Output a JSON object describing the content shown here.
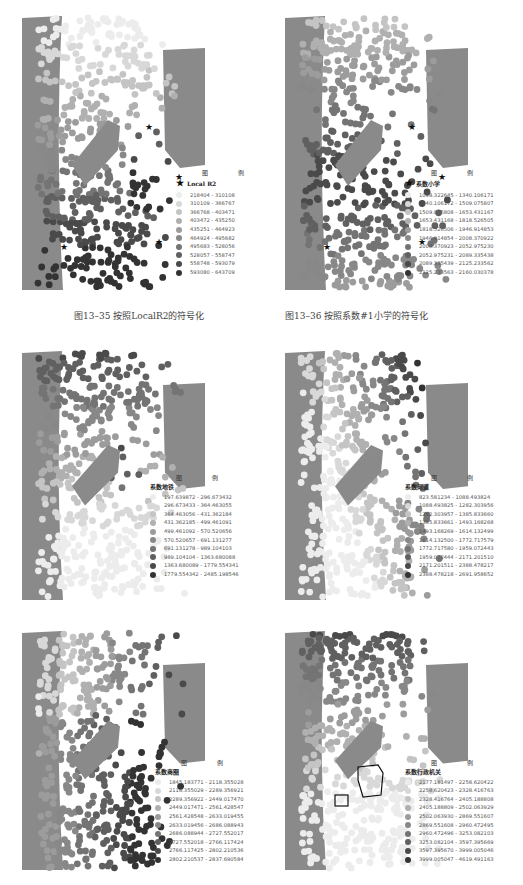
{
  "colors": {
    "water": "#8a8a8a",
    "ramp": [
      "#ececec",
      "#d8d8d8",
      "#c4c4c4",
      "#b0b0b0",
      "#9c9c9c",
      "#888888",
      "#747474",
      "#606060",
      "#4a4a4a",
      "#333333"
    ]
  },
  "panels": [
    {
      "legend_title": "图    例",
      "field": "Local R2",
      "field_icon": "★",
      "classes": [
        "218404 - 310108",
        "310109 - 366767",
        "366768 - 403471",
        "403472 - 435250",
        "435251 - 464923",
        "464924 - 495682",
        "495683 - 528056",
        "528057 - 558747",
        "558748 - 593079",
        "593080 - 643709"
      ],
      "caption": "图13–35   按照LocalR2的符号化"
    },
    {
      "legend_title": "图    例",
      "field": "系数小学",
      "field_icon": "★",
      "classes": [
        "1098.322645 - 1340.106171",
        "1340.106172 - 1509.075807",
        "1509.075808 - 1653.431167",
        "1653.431168 - 1818.526505",
        "1818.526506 - 1946.914853",
        "1946.914854 - 2008.370922",
        "2008.370923 - 2052.975230",
        "2052.975231 - 2089.335438",
        "2089.335439 - 2125.233562",
        "2125.233563 - 2160.030378"
      ],
      "caption": "图13–36   按照系数#1小学的符号化"
    },
    {
      "legend_title": "图    例",
      "field": "系数地铁",
      "field_icon": "",
      "classes": [
        "197.639872 - 296.673432",
        "296.673433 - 364.463055",
        "364.463056 - 431.362184",
        "431.362185 - 499.461091",
        "499.461092 - 570.520656",
        "570.520657 - 691.131277",
        "691.131278 - 989.104103",
        "989.104104 - 1363.680088",
        "1363.680089 - 1779.554341",
        "1779.554342 - 2485.198546"
      ],
      "caption": ""
    },
    {
      "legend_title": "图    例",
      "field": "系数河道",
      "field_icon": "",
      "classes": [
        "823.581234 - 1088.493824",
        "1088.493825 - 1282.303956",
        "1282.303957 - 1385.833660",
        "1385.833661 - 1493.168268",
        "1493.168269 - 1614.132499",
        "1614.132500 - 1772.717579",
        "1772.717580 - 1959.072443",
        "1959.072444 - 2171.201510",
        "2171.201511 - 2388.478217",
        "2388.478218 - 2691.958652"
      ],
      "caption": ""
    },
    {
      "legend_title": "图    例",
      "field": "系数商圈",
      "field_icon": "",
      "classes": [
        "1845.183771 - 2118.355028",
        "2118.355029 - 2289.356921",
        "2289.356922 - 2449.017470",
        "2449.017471 - 2561.428547",
        "2561.428548 - 2633.019455",
        "2633.019456 - 2686.088943",
        "2686.088944 - 2727.552017",
        "2727.552018 - 2766.117424",
        "2766.117425 - 2802.210536",
        "2802.210537 - 2837.690584"
      ],
      "caption": ""
    },
    {
      "legend_title": "图    例",
      "field": "系数行政机关",
      "field_icon": "",
      "classes": [
        "2177.181497 - 2258.620422",
        "2258.620423 - 2328.416763",
        "2328.416764 - 2405.188808",
        "2405.188809 - 2502.063929",
        "2502.063930 - 2869.551607",
        "2869.551608 - 2960.472495",
        "2960.472496 - 3253.082103",
        "3253.082104 - 3597.395669",
        "3597.395670 - 3999.005046",
        "3999.005047 - 4619.491163"
      ],
      "caption": ""
    }
  ]
}
